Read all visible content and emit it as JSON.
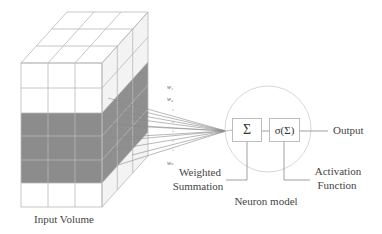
{
  "input_volume": {
    "label": "Input Volume",
    "grid": {
      "columns": 3,
      "rows": 6,
      "depth": 3
    },
    "highlighted_rows": [
      2,
      3,
      4
    ],
    "highlight_color": "#8c8c8c",
    "line_color": "#b5b5b5"
  },
  "weights": {
    "labels": [
      "w1",
      "w2",
      "wn"
    ],
    "display": [
      "w₁",
      "w₂",
      "wₙ"
    ]
  },
  "neuron": {
    "label": "Neuron model",
    "summation_symbol": "Σ",
    "activation_symbol": "σ(Σ)",
    "output_label": "Output",
    "summation_label_line1": "Weighted",
    "summation_label_line2": "Summation",
    "activation_label_line1": "Activation",
    "activation_label_line2": "Function"
  },
  "colors": {
    "text": "#444444",
    "lines": "#9a9a9a",
    "circle": "#d6d6d6",
    "gray_face": "#8c8c8c"
  }
}
